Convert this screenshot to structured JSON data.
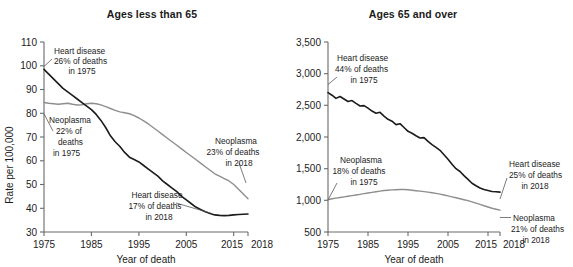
{
  "figure": {
    "background": "#ffffff",
    "series_colors": {
      "heart_disease": "#1b1b1b",
      "neoplasms": "#8e8e8e"
    }
  },
  "panels": [
    {
      "title": "Ages less than 65",
      "ylabel": "Rate per 100,000",
      "xlabel": "Year of death",
      "yticks": [
        "30",
        "40",
        "50",
        "60",
        "70",
        "80",
        "90",
        "100",
        "110"
      ],
      "xticks": [
        "1975",
        "1985",
        "1995",
        "2005",
        "2015",
        "2018"
      ],
      "annotations": [
        {
          "name": "heart-1975",
          "lines": [
            "Heart disease",
            "26% of deaths",
            "in 1975"
          ]
        },
        {
          "name": "neoplasms-1975",
          "lines": [
            "Neoplasma",
            "22% of",
            "deaths",
            "in 1975"
          ]
        },
        {
          "name": "heart-2018",
          "lines": [
            "Heart disease",
            "17% of deaths",
            "in 2018"
          ]
        },
        {
          "name": "neoplasms-2018",
          "lines": [
            "Neoplasma",
            "23% of deaths",
            "in 2018"
          ]
        }
      ]
    },
    {
      "title": "Ages 65 and over",
      "ylabel": "",
      "xlabel": "Year of death",
      "yticks": [
        "500",
        "1,000",
        "1,500",
        "2,000",
        "2,500",
        "3,000",
        "3,500"
      ],
      "xticks": [
        "1975",
        "1985",
        "1995",
        "2005",
        "2015",
        "2018"
      ],
      "annotations": [
        {
          "name": "heart-1975",
          "lines": [
            "Heart disease",
            "44% of deaths",
            "in 1975"
          ]
        },
        {
          "name": "neoplasms-1975",
          "lines": [
            "Neoplasma",
            "18% of deaths",
            "in 1975"
          ]
        },
        {
          "name": "heart-2018",
          "lines": [
            "Heart disease",
            "25% of deaths",
            "in 2018"
          ]
        },
        {
          "name": "neoplasms-2018",
          "lines": [
            "Neoplasma",
            "21% of deaths",
            "in 2018"
          ]
        }
      ]
    }
  ],
  "chart_data": [
    {
      "type": "line",
      "title": "Ages less than 65",
      "xlabel": "Year of death",
      "ylabel": "Rate per 100,000",
      "xlim": [
        1975,
        2018
      ],
      "ylim": [
        30,
        110
      ],
      "grid": false,
      "legend": "annotations",
      "x": [
        1975,
        1976,
        1977,
        1978,
        1979,
        1980,
        1981,
        1982,
        1983,
        1984,
        1985,
        1986,
        1987,
        1988,
        1989,
        1990,
        1991,
        1992,
        1993,
        1994,
        1995,
        1996,
        1997,
        1998,
        1999,
        2000,
        2001,
        2002,
        2003,
        2004,
        2005,
        2006,
        2007,
        2008,
        2009,
        2010,
        2011,
        2012,
        2013,
        2014,
        2015,
        2016,
        2017,
        2018
      ],
      "series": [
        {
          "name": "Heart disease",
          "color": "#1b1b1b",
          "values": [
            98.5,
            96.5,
            94.5,
            92.5,
            90.5,
            89.0,
            87.5,
            86.0,
            84.5,
            83.0,
            81.5,
            79.5,
            77.0,
            74.0,
            70.5,
            68.0,
            66.0,
            63.5,
            61.5,
            60.5,
            59.5,
            58.0,
            56.5,
            55.0,
            53.5,
            51.5,
            50.0,
            48.5,
            47.0,
            45.0,
            43.5,
            42.0,
            40.5,
            39.5,
            38.5,
            37.8,
            37.2,
            37.0,
            36.9,
            37.0,
            37.2,
            37.4,
            37.5,
            37.6
          ]
        },
        {
          "name": "Neoplasms",
          "color": "#8e8e8e",
          "values": [
            84.5,
            84.2,
            84.0,
            83.8,
            84.0,
            84.2,
            83.8,
            83.5,
            83.6,
            84.0,
            84.2,
            84.0,
            83.5,
            82.8,
            82.0,
            81.2,
            80.6,
            80.2,
            79.8,
            79.0,
            78.0,
            76.8,
            75.5,
            74.0,
            72.5,
            71.0,
            69.5,
            68.0,
            66.5,
            65.0,
            63.5,
            62.0,
            60.5,
            59.0,
            57.5,
            56.0,
            54.5,
            53.5,
            52.5,
            51.5,
            50.0,
            48.0,
            46.0,
            44.0
          ]
        }
      ],
      "annotations": [
        {
          "text": "Heart disease 26% of deaths in 1975",
          "points_to": {
            "x": 1975,
            "y": 98.5
          }
        },
        {
          "text": "Neoplasma 22% of deaths in 1975",
          "points_to": {
            "x": 1975,
            "y": 84.5
          }
        },
        {
          "text": "Heart disease 17% of deaths in 2018",
          "points_to": {
            "x": 2018,
            "y": 37.6
          }
        },
        {
          "text": "Neoplasma 23% of deaths in 2018",
          "points_to": {
            "x": 2018,
            "y": 44.0
          }
        }
      ]
    },
    {
      "type": "line",
      "title": "Ages 65 and over",
      "xlabel": "Year of death",
      "ylabel": "Rate per 100,000",
      "xlim": [
        1975,
        2018
      ],
      "ylim": [
        500,
        3500
      ],
      "grid": false,
      "legend": "annotations",
      "x": [
        1975,
        1976,
        1977,
        1978,
        1979,
        1980,
        1981,
        1982,
        1983,
        1984,
        1985,
        1986,
        1987,
        1988,
        1989,
        1990,
        1991,
        1992,
        1993,
        1994,
        1995,
        1996,
        1997,
        1998,
        1999,
        2000,
        2001,
        2002,
        2003,
        2004,
        2005,
        2006,
        2007,
        2008,
        2009,
        2010,
        2011,
        2012,
        2013,
        2014,
        2015,
        2016,
        2017,
        2018
      ],
      "series": [
        {
          "name": "Heart disease",
          "color": "#1b1b1b",
          "values": [
            2700,
            2660,
            2610,
            2640,
            2600,
            2560,
            2575,
            2530,
            2490,
            2495,
            2455,
            2410,
            2375,
            2390,
            2330,
            2280,
            2250,
            2195,
            2210,
            2150,
            2090,
            2060,
            2020,
            1985,
            1990,
            1930,
            1880,
            1835,
            1790,
            1720,
            1650,
            1570,
            1500,
            1455,
            1390,
            1330,
            1270,
            1230,
            1195,
            1170,
            1155,
            1140,
            1135,
            1130
          ]
        },
        {
          "name": "Neoplasms",
          "color": "#8e8e8e",
          "values": [
            1010,
            1025,
            1035,
            1045,
            1055,
            1065,
            1075,
            1085,
            1095,
            1105,
            1115,
            1125,
            1135,
            1145,
            1155,
            1160,
            1165,
            1168,
            1170,
            1172,
            1168,
            1160,
            1152,
            1145,
            1138,
            1130,
            1120,
            1110,
            1098,
            1085,
            1070,
            1055,
            1040,
            1025,
            1010,
            995,
            975,
            955,
            935,
            915,
            895,
            875,
            860,
            845
          ]
        }
      ],
      "annotations": [
        {
          "text": "Heart disease 44% of deaths in 1975",
          "points_to": {
            "x": 1975,
            "y": 2700
          }
        },
        {
          "text": "Neoplasma 18% of deaths in 1975",
          "points_to": {
            "x": 1975,
            "y": 1010
          }
        },
        {
          "text": "Heart disease 25% of deaths in 2018",
          "points_to": {
            "x": 2018,
            "y": 1130
          }
        },
        {
          "text": "Neoplasma 21% of deaths in 2018",
          "points_to": {
            "x": 2018,
            "y": 845
          }
        }
      ]
    }
  ]
}
